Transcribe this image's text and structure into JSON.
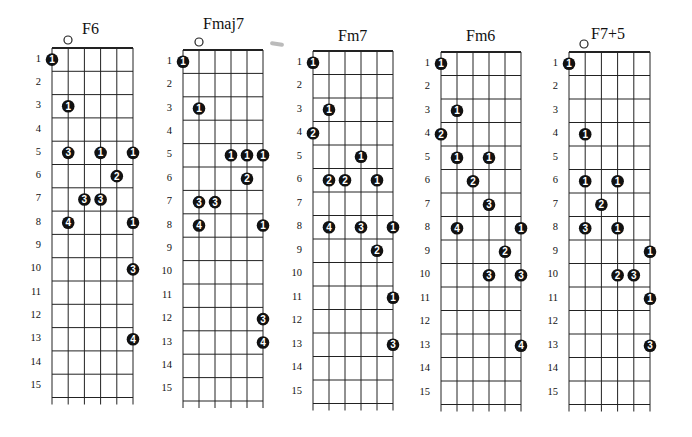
{
  "frets": [
    "1",
    "2",
    "3",
    "4",
    "5",
    "6",
    "7",
    "8",
    "9",
    "10",
    "11",
    "12",
    "13",
    "14",
    "15"
  ],
  "charts": [
    {
      "name": "F6",
      "open_marker": true,
      "open_string": 2,
      "geometry": {
        "left": 52,
        "top": 48,
        "string_gap": 16.2,
        "fret_gap": 23.3,
        "title_x": 82,
        "title_y": 20,
        "open_x": 68,
        "open_y": 40
      },
      "dots": [
        {
          "fret": 1,
          "string": 0,
          "finger": "1"
        },
        {
          "fret": 3,
          "string": 1,
          "finger": "1"
        },
        {
          "fret": 5,
          "string": 1,
          "finger": "3"
        },
        {
          "fret": 5,
          "string": 3,
          "finger": "1"
        },
        {
          "fret": 5,
          "string": 5,
          "finger": "1"
        },
        {
          "fret": 6,
          "string": 4,
          "finger": "2"
        },
        {
          "fret": 7,
          "string": 2,
          "finger": "3"
        },
        {
          "fret": 7,
          "string": 3,
          "finger": "3"
        },
        {
          "fret": 8,
          "string": 1,
          "finger": "4"
        },
        {
          "fret": 8,
          "string": 5,
          "finger": "1"
        },
        {
          "fret": 10,
          "string": 5,
          "finger": "3"
        },
        {
          "fret": 13,
          "string": 5,
          "finger": "4"
        }
      ]
    },
    {
      "name": "Fmaj7",
      "open_marker": true,
      "open_string": 1,
      "geometry": {
        "left": 183,
        "top": 50,
        "string_gap": 16.0,
        "fret_gap": 23.4,
        "title_x": 203,
        "title_y": 15,
        "open_x": 199,
        "open_y": 42
      },
      "dots": [
        {
          "fret": 1,
          "string": 0,
          "finger": "1"
        },
        {
          "fret": 3,
          "string": 1,
          "finger": "1"
        },
        {
          "fret": 5,
          "string": 3,
          "finger": "1"
        },
        {
          "fret": 5,
          "string": 4,
          "finger": "1"
        },
        {
          "fret": 5,
          "string": 5,
          "finger": "1"
        },
        {
          "fret": 6,
          "string": 4,
          "finger": "2"
        },
        {
          "fret": 7,
          "string": 1,
          "finger": "3"
        },
        {
          "fret": 7,
          "string": 2,
          "finger": "3"
        },
        {
          "fret": 8,
          "string": 1,
          "finger": "4"
        },
        {
          "fret": 8,
          "string": 5,
          "finger": "1"
        },
        {
          "fret": 12,
          "string": 5,
          "finger": "3"
        },
        {
          "fret": 13,
          "string": 5,
          "finger": "4"
        }
      ]
    },
    {
      "name": "Fm7",
      "open_marker": false,
      "geometry": {
        "left": 313,
        "top": 51,
        "string_gap": 16.0,
        "fret_gap": 23.5,
        "title_x": 338,
        "title_y": 27
      },
      "dots": [
        {
          "fret": 1,
          "string": 0,
          "finger": "1"
        },
        {
          "fret": 3,
          "string": 1,
          "finger": "1"
        },
        {
          "fret": 4,
          "string": 0,
          "finger": "2"
        },
        {
          "fret": 5,
          "string": 3,
          "finger": "1"
        },
        {
          "fret": 6,
          "string": 1,
          "finger": "2"
        },
        {
          "fret": 6,
          "string": 2,
          "finger": "2"
        },
        {
          "fret": 6,
          "string": 4,
          "finger": "1"
        },
        {
          "fret": 8,
          "string": 1,
          "finger": "4"
        },
        {
          "fret": 8,
          "string": 3,
          "finger": "3"
        },
        {
          "fret": 8,
          "string": 5,
          "finger": "1"
        },
        {
          "fret": 9,
          "string": 4,
          "finger": "2"
        },
        {
          "fret": 11,
          "string": 5,
          "finger": "1"
        },
        {
          "fret": 13,
          "string": 5,
          "finger": "3"
        }
      ]
    },
    {
      "name": "Fm6",
      "open_marker": false,
      "geometry": {
        "left": 441,
        "top": 52,
        "string_gap": 16.0,
        "fret_gap": 23.5,
        "title_x": 466,
        "title_y": 27
      },
      "dots": [
        {
          "fret": 1,
          "string": 0,
          "finger": "1"
        },
        {
          "fret": 3,
          "string": 1,
          "finger": "1"
        },
        {
          "fret": 4,
          "string": 0,
          "finger": "2"
        },
        {
          "fret": 5,
          "string": 1,
          "finger": "1"
        },
        {
          "fret": 5,
          "string": 3,
          "finger": "1"
        },
        {
          "fret": 6,
          "string": 2,
          "finger": "2"
        },
        {
          "fret": 7,
          "string": 3,
          "finger": "3"
        },
        {
          "fret": 8,
          "string": 1,
          "finger": "4"
        },
        {
          "fret": 8,
          "string": 5,
          "finger": "1"
        },
        {
          "fret": 9,
          "string": 4,
          "finger": "2"
        },
        {
          "fret": 10,
          "string": 3,
          "finger": "3"
        },
        {
          "fret": 10,
          "string": 5,
          "finger": "3"
        },
        {
          "fret": 13,
          "string": 5,
          "finger": "4"
        }
      ]
    },
    {
      "name": "F7+5",
      "open_marker": true,
      "open_string": 1,
      "geometry": {
        "left": 569,
        "top": 52,
        "string_gap": 16.2,
        "fret_gap": 23.5,
        "title_x": 591,
        "title_y": 25,
        "open_x": 584,
        "open_y": 44
      },
      "dots": [
        {
          "fret": 1,
          "string": 0,
          "finger": "1"
        },
        {
          "fret": 4,
          "string": 1,
          "finger": "1"
        },
        {
          "fret": 6,
          "string": 1,
          "finger": "1"
        },
        {
          "fret": 6,
          "string": 3,
          "finger": "1"
        },
        {
          "fret": 7,
          "string": 2,
          "finger": "2"
        },
        {
          "fret": 8,
          "string": 1,
          "finger": "3"
        },
        {
          "fret": 8,
          "string": 3,
          "finger": "1"
        },
        {
          "fret": 9,
          "string": 5,
          "finger": "1"
        },
        {
          "fret": 10,
          "string": 3,
          "finger": "2"
        },
        {
          "fret": 10,
          "string": 4,
          "finger": "3"
        },
        {
          "fret": 11,
          "string": 5,
          "finger": "1"
        },
        {
          "fret": 13,
          "string": 5,
          "finger": "3"
        }
      ]
    }
  ],
  "colors": {
    "line": "#222222",
    "dot": "#111111",
    "dot_text": "#ffffff",
    "background": "#ffffff"
  }
}
